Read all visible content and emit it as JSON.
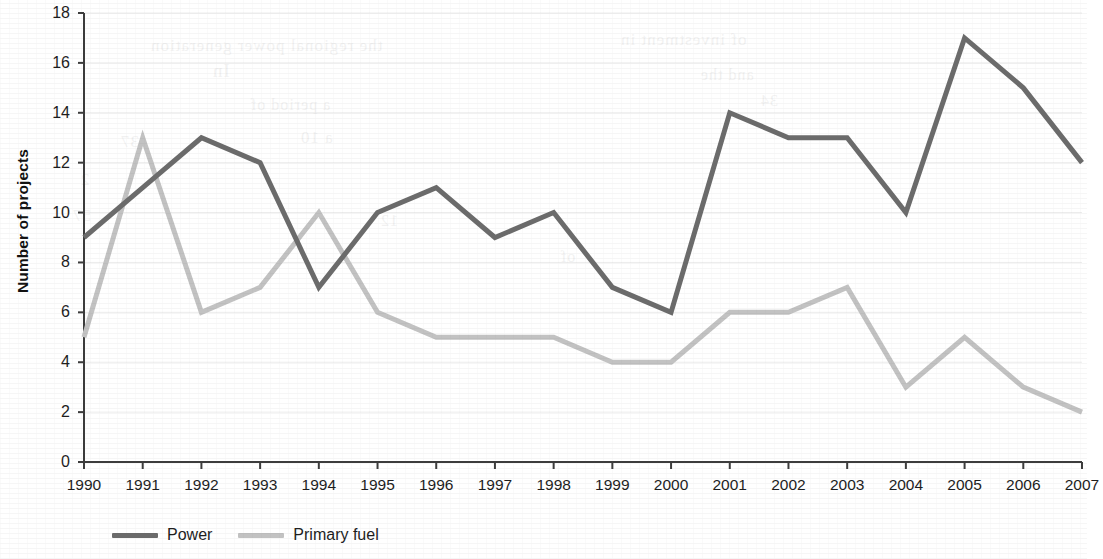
{
  "chart_data": {
    "type": "line",
    "title": "",
    "subtitle": "",
    "xlabel": "",
    "ylabel": "Number of projects",
    "categories": [
      "1990",
      "1991",
      "1992",
      "1993",
      "1994",
      "1995",
      "1996",
      "1997",
      "1998",
      "1999",
      "2000",
      "2001",
      "2002",
      "2003",
      "2004",
      "2005",
      "2006",
      "2007"
    ],
    "x": [
      1990,
      1991,
      1992,
      1993,
      1994,
      1995,
      1996,
      1997,
      1998,
      1999,
      2000,
      2001,
      2002,
      2003,
      2004,
      2005,
      2006,
      2007
    ],
    "series": [
      {
        "name": "Power",
        "color": "#6b6b6b",
        "line_width": 5,
        "values": [
          9,
          11,
          13,
          12,
          7,
          10,
          11,
          9,
          10,
          7,
          6,
          14,
          13,
          13,
          10,
          17,
          15,
          12
        ]
      },
      {
        "name": "Primary fuel",
        "color": "#c2c2c2",
        "line_width": 5,
        "values": [
          5,
          13,
          6,
          7,
          10,
          6,
          5,
          5,
          5,
          4,
          4,
          6,
          6,
          7,
          3,
          5,
          3,
          2
        ]
      }
    ],
    "ylim": [
      0,
      18
    ],
    "ytick_step": 2,
    "yticks": [
      0,
      2,
      4,
      6,
      8,
      10,
      12,
      14,
      16,
      18
    ],
    "ytick_labels": [
      "0",
      "2",
      "4",
      "6",
      "8",
      "10",
      "12",
      "14",
      "16",
      "18"
    ],
    "xlim": [
      1990,
      2007
    ],
    "grid": true,
    "grid_axis": "y",
    "grid_color": "#ececec",
    "legend_position": "bottom-left",
    "axis_color": "#3c3c3c",
    "background": "#ffffff"
  },
  "legend": {
    "entries": [
      {
        "label": "Power",
        "color": "#6b6b6b"
      },
      {
        "label": "Primary fuel",
        "color": "#c2c2c2"
      }
    ]
  },
  "ghost_text": [
    {
      "text": "the regional power generation",
      "x": 150,
      "y": 36,
      "size": 17
    },
    {
      "text": "of investment in",
      "x": 620,
      "y": 30,
      "size": 17
    },
    {
      "text": "In",
      "x": 212,
      "y": 60,
      "size": 19
    },
    {
      "text": "and the",
      "x": 700,
      "y": 66,
      "size": 16
    },
    {
      "text": "a period of",
      "x": 250,
      "y": 96,
      "size": 16
    },
    {
      "text": "34",
      "x": 760,
      "y": 92,
      "size": 16
    },
    {
      "text": "37",
      "x": 120,
      "y": 132,
      "size": 17
    },
    {
      "text": "a 10",
      "x": 300,
      "y": 128,
      "size": 17
    },
    {
      "text": "2",
      "x": 80,
      "y": 170,
      "size": 17
    },
    {
      "text": "57",
      "x": 72,
      "y": 206,
      "size": 17
    },
    {
      "text": "12",
      "x": 380,
      "y": 212,
      "size": 16
    },
    {
      "text": "of",
      "x": 560,
      "y": 248,
      "size": 16
    }
  ]
}
